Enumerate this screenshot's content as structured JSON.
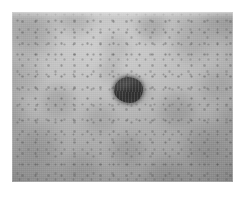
{
  "image": {
    "kind": "photograph",
    "subject": "skin-lesion",
    "modality": "clinical dermatology close-up",
    "color_mode": "grayscale",
    "width_px": 245,
    "height_px": 197,
    "caption": "",
    "visible_text": ""
  },
  "plate": {
    "name": "photo-plate",
    "left_px": 12,
    "top_px": 12,
    "width_px": 221,
    "height_px": 170,
    "background_color": "#b0b0b0",
    "page_background_color": "#ffffff"
  },
  "skin": {
    "label": "skin-background",
    "tone_light_hex": "#c4c4c4",
    "tone_mid_hex": "#b0b0b0",
    "tone_dark_hex": "#9a9a9a",
    "texture": "mottled with fine dark speckles",
    "speckle_hex": "#5c5c5c"
  },
  "lesion": {
    "label": "pigmented-lesion",
    "shape": "irregular rounded blob",
    "center_x_px": 128,
    "center_y_px": 90,
    "width_px": 29,
    "height_px": 26,
    "fill_hex": "#454545",
    "highlight_hex": "#565656",
    "shadow_hex": "#3a3a3a",
    "border": "soft blurred margin"
  }
}
